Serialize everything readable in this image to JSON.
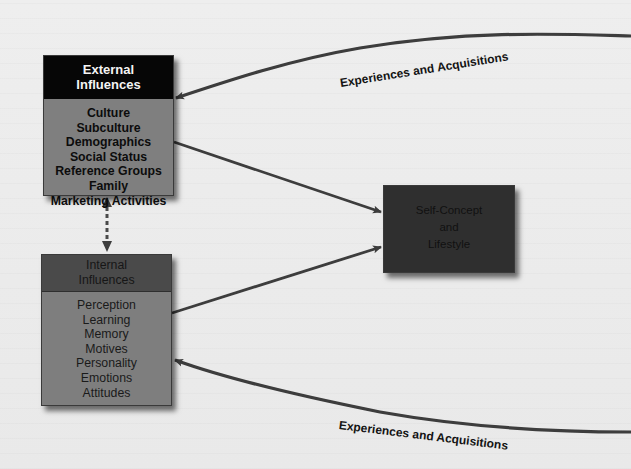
{
  "diagram": {
    "external_influences": {
      "title_line1": "External",
      "title_line2": "Influences",
      "items": [
        "Culture",
        "Subculture",
        "Demographics",
        "Social Status",
        "Reference Groups",
        "Family",
        "Marketing Activities"
      ],
      "header_color": "#060606",
      "body_color": "#7f7f7f"
    },
    "internal_influences": {
      "title_line1": "Internal",
      "title_line2": "Influences",
      "items": [
        "Perception",
        "Learning",
        "Memory",
        "Motives",
        "Personality",
        "Emotions",
        "Attitudes"
      ],
      "header_color": "#4a4a4a",
      "body_color": "#7e7e7e"
    },
    "self_concept": {
      "line1": "Self-Concept",
      "line2": "and",
      "line3": "Lifestyle",
      "box_color": "#2f2f2f"
    },
    "feedback_labels": {
      "top": "Experiences and Acquisitions",
      "bottom": "Experiences and Acquisitions"
    },
    "connector_color": "#3c3c3c"
  }
}
